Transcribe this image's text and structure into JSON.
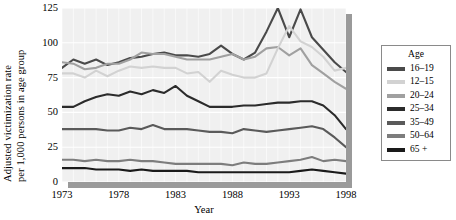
{
  "chart_data": {
    "type": "line",
    "title": "",
    "xlabel": "Year",
    "ylabel": "Adjusted victimization rate per 1,000 persons in age group",
    "ylabel_line1": "Adjusted victimization rate",
    "ylabel_line2": "per 1,000 persons in age group",
    "xlim": [
      1973,
      1998
    ],
    "ylim": [
      0,
      125
    ],
    "yticks": [
      0,
      25,
      50,
      75,
      100,
      125
    ],
    "xticks": [
      1973,
      1978,
      1983,
      1988,
      1993,
      1998
    ],
    "grid": true,
    "grid_color": "#ffffff",
    "panel_background": "#f0f0f0",
    "legend_position": "right",
    "legend_title": "Age",
    "x": [
      1973,
      1974,
      1975,
      1976,
      1977,
      1978,
      1979,
      1980,
      1981,
      1982,
      1983,
      1984,
      1985,
      1986,
      1987,
      1988,
      1989,
      1990,
      1991,
      1992,
      1993,
      1994,
      1995,
      1996,
      1997,
      1998
    ],
    "series": [
      {
        "name": "16-19",
        "label": "16–19",
        "color": "#4a4a4a",
        "values": [
          82,
          88,
          85,
          88,
          84,
          86,
          89,
          90,
          92,
          93,
          91,
          91,
          90,
          92,
          98,
          92,
          88,
          93,
          108,
          125,
          104,
          124,
          104,
          95,
          86,
          79
        ]
      },
      {
        "name": "12-15",
        "label": "12–15",
        "color": "#d2d2d2",
        "values": [
          78,
          78,
          75,
          80,
          76,
          80,
          83,
          82,
          83,
          82,
          82,
          78,
          79,
          72,
          80,
          77,
          75,
          75,
          78,
          96,
          112,
          101,
          97,
          90,
          80,
          82
        ]
      },
      {
        "name": "20-24",
        "label": "20–24",
        "color": "#a0a0a0",
        "values": [
          86,
          85,
          81,
          82,
          85,
          85,
          88,
          93,
          92,
          92,
          90,
          88,
          88,
          88,
          90,
          92,
          88,
          90,
          96,
          97,
          91,
          96,
          84,
          78,
          72,
          67
        ]
      },
      {
        "name": "25-34",
        "label": "25–34",
        "color": "#2b2b2b",
        "values": [
          54,
          54,
          58,
          61,
          63,
          62,
          65,
          63,
          66,
          64,
          69,
          62,
          58,
          54,
          54,
          54,
          55,
          55,
          56,
          57,
          57,
          58,
          58,
          55,
          48,
          38
        ]
      },
      {
        "name": "35-49",
        "label": "35–49",
        "color": "#5a5a5a",
        "values": [
          38,
          38,
          38,
          38,
          37,
          37,
          39,
          38,
          41,
          38,
          38,
          38,
          37,
          36,
          36,
          35,
          38,
          37,
          36,
          37,
          38,
          39,
          40,
          38,
          32,
          25
        ]
      },
      {
        "name": "50-64",
        "label": "50–64",
        "color": "#7d7d7d",
        "values": [
          16,
          16,
          15,
          16,
          15,
          15,
          16,
          15,
          15,
          14,
          13,
          13,
          13,
          13,
          13,
          12,
          14,
          13,
          13,
          14,
          15,
          16,
          18,
          15,
          16,
          15
        ]
      },
      {
        "name": "65+",
        "label": "65 +",
        "color": "#1a1a1a",
        "values": [
          10,
          10,
          10,
          9,
          9,
          9,
          8,
          9,
          8,
          8,
          8,
          8,
          7,
          7,
          7,
          7,
          7,
          7,
          7,
          7,
          7,
          8,
          9,
          8,
          7,
          6
        ]
      }
    ]
  }
}
